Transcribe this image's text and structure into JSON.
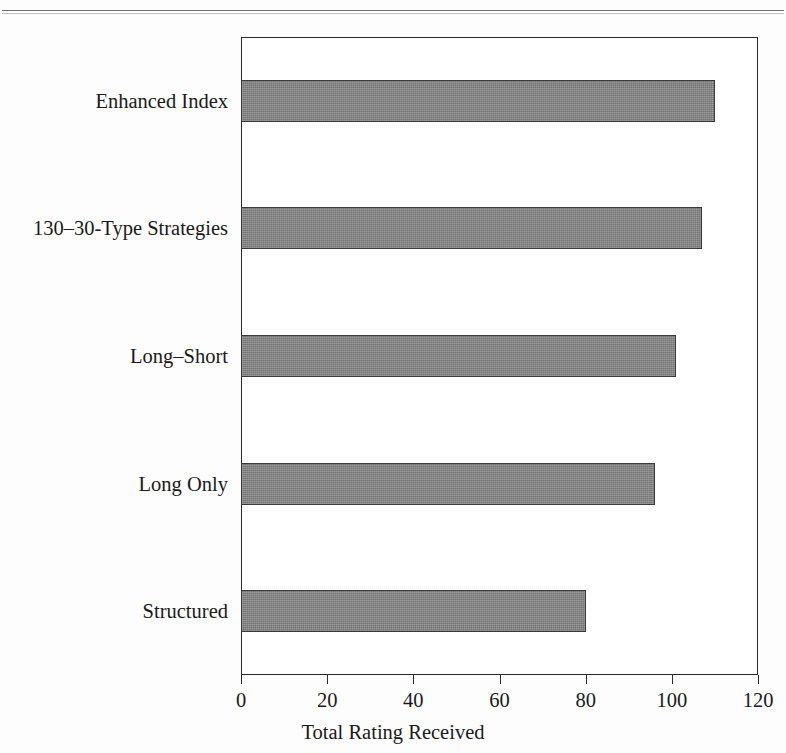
{
  "page": {
    "rule_present": true
  },
  "chart_data": {
    "type": "bar",
    "orientation": "horizontal",
    "title": "",
    "xlabel": "Total Rating Received",
    "ylabel": "",
    "categories": [
      "Enhanced Index",
      "130–30-Type Strategies",
      "Long–Short",
      "Long Only",
      "Structured"
    ],
    "values": [
      110,
      107,
      101,
      96,
      80
    ],
    "xlim": [
      0,
      120
    ],
    "xticks": [
      0,
      20,
      40,
      60,
      80,
      100,
      120
    ],
    "xtick_labels": [
      "0",
      "20",
      "40",
      "60",
      "80",
      "100",
      "120"
    ],
    "grid": false,
    "legend": null,
    "bar_fill_color": "#808080",
    "bar_edge_color": "#3a3a3a",
    "axis_color": "#2b2b2b",
    "background_color": "#ffffff"
  }
}
